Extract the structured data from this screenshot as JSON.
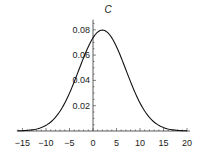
{
  "chart_data": {
    "type": "line",
    "title": "C",
    "xlabel": "",
    "ylabel": "",
    "xlim": [
      -16,
      20
    ],
    "ylim": [
      0,
      0.088
    ],
    "x_ticks": [
      -15,
      -10,
      -5,
      0,
      5,
      10,
      15,
      20
    ],
    "x_tick_labels": [
      "−15",
      "−10",
      "−5",
      "0",
      "5",
      "10",
      "15",
      "20"
    ],
    "y_ticks": [
      0.02,
      0.04,
      0.06,
      0.08
    ],
    "y_tick_labels": [
      "0.02",
      "0.04",
      "0.06",
      "0.08"
    ],
    "grid": false,
    "legend": null,
    "series": [
      {
        "name": "C",
        "distribution": "normal",
        "mean": 2,
        "sd": 5,
        "x": [
          -16,
          -14,
          -12,
          -10,
          -8,
          -6,
          -4,
          -2,
          0,
          2,
          4,
          6,
          8,
          10,
          12,
          14,
          16,
          18,
          20
        ],
        "values": [
          0.0012,
          0.0047,
          0.008,
          0.0045,
          0.0108,
          0.0222,
          0.0388,
          0.0579,
          0.0737,
          0.0798,
          0.0737,
          0.0579,
          0.0388,
          0.0222,
          0.0108,
          0.0045,
          0.0016,
          0.0005,
          0.0001
        ]
      }
    ]
  }
}
